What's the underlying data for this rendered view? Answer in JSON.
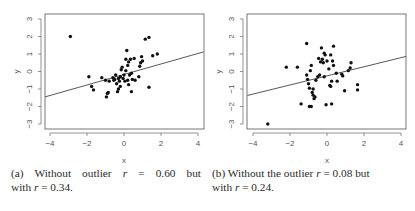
{
  "chart_data": [
    {
      "type": "scatter",
      "panel": "a",
      "title": "",
      "xlabel": "x",
      "ylabel": "y",
      "xlim": [
        -4.3,
        4.3
      ],
      "ylim": [
        -3.2,
        3.2
      ],
      "xticks": [
        -4,
        -2,
        0,
        2,
        4
      ],
      "yticks": [
        -3,
        -2,
        -1,
        0,
        1,
        2,
        3
      ],
      "grid": false,
      "regression_line": {
        "slope": 0.3,
        "intercept": -0.17
      },
      "outlier": {
        "x": -2.9,
        "y": 2.0
      },
      "points": [
        [
          -2.9,
          2.0
        ],
        [
          -1.9,
          -0.3
        ],
        [
          -1.75,
          -0.85
        ],
        [
          -1.65,
          -1.05
        ],
        [
          -1.2,
          -0.35
        ],
        [
          -1.0,
          -0.5
        ],
        [
          -0.95,
          -1.45
        ],
        [
          -0.9,
          -1.25
        ],
        [
          -0.85,
          -1.2
        ],
        [
          -0.8,
          -0.55
        ],
        [
          -0.6,
          -0.35
        ],
        [
          -0.55,
          -0.5
        ],
        [
          -0.5,
          -0.45
        ],
        [
          -0.45,
          -0.2
        ],
        [
          -0.4,
          -0.7
        ],
        [
          -0.35,
          -1.15
        ],
        [
          -0.3,
          -1.0
        ],
        [
          -0.3,
          -0.4
        ],
        [
          -0.25,
          -0.55
        ],
        [
          -0.2,
          -0.85
        ],
        [
          -0.2,
          -0.3
        ],
        [
          -0.15,
          0.1
        ],
        [
          -0.1,
          0.25
        ],
        [
          -0.05,
          -0.4
        ],
        [
          0.0,
          -0.2
        ],
        [
          0.05,
          -0.55
        ],
        [
          0.1,
          0.05
        ],
        [
          0.1,
          0.7
        ],
        [
          0.15,
          1.2
        ],
        [
          0.2,
          -0.5
        ],
        [
          0.2,
          0.35
        ],
        [
          0.25,
          -0.75
        ],
        [
          0.25,
          0.55
        ],
        [
          0.3,
          -0.2
        ],
        [
          0.35,
          0.7
        ],
        [
          0.4,
          -1.15
        ],
        [
          0.4,
          -0.1
        ],
        [
          0.45,
          -0.45
        ],
        [
          0.55,
          0.75
        ],
        [
          0.6,
          -0.5
        ],
        [
          0.8,
          -0.3
        ],
        [
          0.85,
          0.3
        ],
        [
          0.9,
          0.5
        ],
        [
          0.95,
          0.85
        ],
        [
          1.0,
          0.6
        ],
        [
          1.15,
          1.85
        ],
        [
          1.35,
          1.95
        ],
        [
          1.35,
          -0.9
        ],
        [
          1.55,
          0.9
        ],
        [
          1.8,
          1.0
        ]
      ]
    },
    {
      "type": "scatter",
      "panel": "b",
      "title": "",
      "xlabel": "x",
      "ylabel": "y",
      "xlim": [
        -4.3,
        4.3
      ],
      "ylim": [
        -3.2,
        3.2
      ],
      "xticks": [
        -4,
        -2,
        0,
        2,
        4
      ],
      "yticks": [
        -3,
        -2,
        -1,
        0,
        1,
        2,
        3
      ],
      "grid": false,
      "regression_line": {
        "slope": 0.26,
        "intercept": -0.25
      },
      "outlier": {
        "x": -3.2,
        "y": -3.0
      },
      "points": [
        [
          -3.2,
          -3.0
        ],
        [
          -2.2,
          0.25
        ],
        [
          -1.6,
          0.25
        ],
        [
          -1.4,
          -1.85
        ],
        [
          -1.1,
          1.6
        ],
        [
          -1.1,
          -0.2
        ],
        [
          -1.05,
          -0.45
        ],
        [
          -1.0,
          -0.7
        ],
        [
          -0.95,
          -2.0
        ],
        [
          -0.95,
          -0.95
        ],
        [
          -0.9,
          0.05
        ],
        [
          -0.85,
          -2.0
        ],
        [
          -0.85,
          0.35
        ],
        [
          -0.8,
          -1.2
        ],
        [
          -0.75,
          -1.35
        ],
        [
          -0.75,
          -1.0
        ],
        [
          -0.7,
          -1.55
        ],
        [
          -0.65,
          -1.45
        ],
        [
          -0.6,
          -0.5
        ],
        [
          -0.5,
          -0.3
        ],
        [
          -0.45,
          0.75
        ],
        [
          -0.4,
          -0.2
        ],
        [
          -0.35,
          0.55
        ],
        [
          -0.3,
          1.35
        ],
        [
          -0.25,
          0.7
        ],
        [
          -0.2,
          0.5
        ],
        [
          -0.15,
          -0.3
        ],
        [
          -0.15,
          1.05
        ],
        [
          -0.1,
          0.95
        ],
        [
          -0.05,
          -1.9
        ],
        [
          0.0,
          0.6
        ],
        [
          0.1,
          0.15
        ],
        [
          0.15,
          -0.8
        ],
        [
          0.2,
          0.95
        ],
        [
          0.2,
          -0.85
        ],
        [
          0.25,
          -0.55
        ],
        [
          0.25,
          -1.85
        ],
        [
          0.3,
          0.6
        ],
        [
          0.35,
          1.45
        ],
        [
          0.35,
          0.35
        ],
        [
          0.5,
          -0.1
        ],
        [
          0.55,
          -0.55
        ],
        [
          0.8,
          -0.15
        ],
        [
          0.85,
          -0.25
        ],
        [
          0.95,
          -1.1
        ],
        [
          1.15,
          0.05
        ],
        [
          1.25,
          0.2
        ],
        [
          1.3,
          0.5
        ],
        [
          1.65,
          -0.75
        ],
        [
          1.65,
          -1.05
        ]
      ]
    }
  ],
  "captions": {
    "a": {
      "label": "(a)",
      "line1_pre": "Without outlier ",
      "line1_var": "r",
      "line1_post": " = 0.60 but",
      "line2_pre": "with ",
      "line2_var": "r",
      "line2_post": " = 0.34."
    },
    "b": {
      "label": "(b)",
      "line1_pre": "Without the outlier ",
      "line1_var": "r",
      "line1_post": " = 0.08 but",
      "line2_pre": "with ",
      "line2_var": "r",
      "line2_post": " = 0.24."
    }
  }
}
